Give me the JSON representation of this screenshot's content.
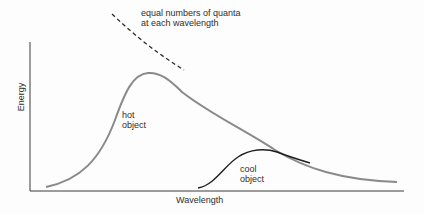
{
  "diagram": {
    "title": "",
    "axes": {
      "ylabel": "Energy",
      "xlabel": "Wavelength"
    },
    "annotation": {
      "lines": [
        "equal numbers of quanta",
        "at each wavelength"
      ]
    },
    "curves": [
      {
        "name": "hot object",
        "label_lines": [
          "hot",
          "object"
        ],
        "color": "#8a8a8a",
        "style": "solid"
      },
      {
        "name": "cool object",
        "label_lines": [
          "cool",
          "object"
        ],
        "color": "#1e1e1e",
        "style": "solid"
      },
      {
        "name": "equal numbers of quanta at each wavelength",
        "color": "#2a2a2a",
        "style": "dashed"
      }
    ],
    "colors": {
      "axis": "#3a3a3a",
      "background": "#fdfdfd"
    }
  }
}
